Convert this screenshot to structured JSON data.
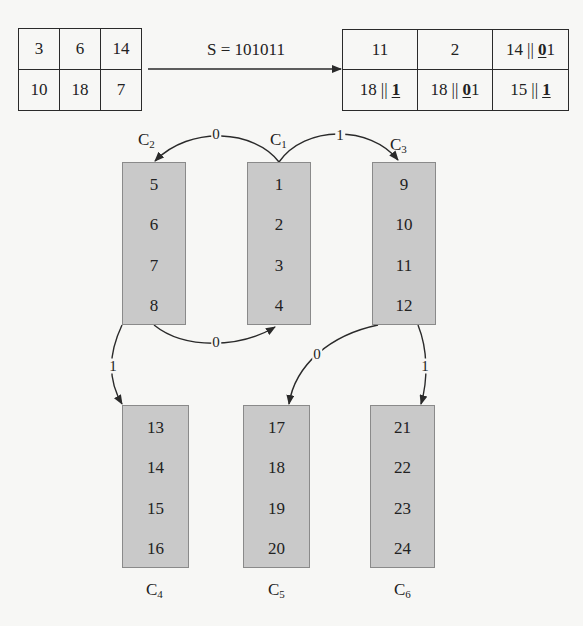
{
  "input_table": {
    "rows": [
      [
        "3",
        "6",
        "14"
      ],
      [
        "10",
        "18",
        "7"
      ]
    ]
  },
  "transform": {
    "label": "S = 101011"
  },
  "output_table": {
    "rows": [
      [
        {
          "value": "11",
          "bits": ""
        },
        {
          "value": "2",
          "bits": ""
        },
        {
          "value": "14",
          "bits_marked": "0",
          "bits_rest": "1"
        }
      ],
      [
        {
          "value": "18",
          "bits_marked": "1",
          "bits_rest": ""
        },
        {
          "value": "18",
          "bits_marked": "0",
          "bits_rest": "1"
        },
        {
          "value": "15",
          "bits_marked": "1",
          "bits_rest": ""
        }
      ]
    ],
    "separator": "||"
  },
  "clusters": [
    {
      "id": "C",
      "sub": "1",
      "items": [
        "1",
        "2",
        "3",
        "4"
      ]
    },
    {
      "id": "C",
      "sub": "2",
      "items": [
        "5",
        "6",
        "7",
        "8"
      ]
    },
    {
      "id": "C",
      "sub": "3",
      "items": [
        "9",
        "10",
        "11",
        "12"
      ]
    },
    {
      "id": "C",
      "sub": "4",
      "items": [
        "13",
        "14",
        "15",
        "16"
      ]
    },
    {
      "id": "C",
      "sub": "5",
      "items": [
        "17",
        "18",
        "19",
        "20"
      ]
    },
    {
      "id": "C",
      "sub": "6",
      "items": [
        "21",
        "22",
        "23",
        "24"
      ]
    }
  ],
  "edges": [
    {
      "from": "C1",
      "to": "C2",
      "label": "0"
    },
    {
      "from": "C1",
      "to": "C3",
      "label": "1"
    },
    {
      "from": "C2",
      "to": "C1",
      "label": "0"
    },
    {
      "from": "C2",
      "to": "C4",
      "label": "1"
    },
    {
      "from": "C3",
      "to": "C5",
      "label": "0"
    },
    {
      "from": "C3",
      "to": "C6",
      "label": "1"
    }
  ],
  "colors": {
    "node_fill": "#c9c9c9",
    "line": "#2a2a2a",
    "background": "#f7f7f5"
  }
}
